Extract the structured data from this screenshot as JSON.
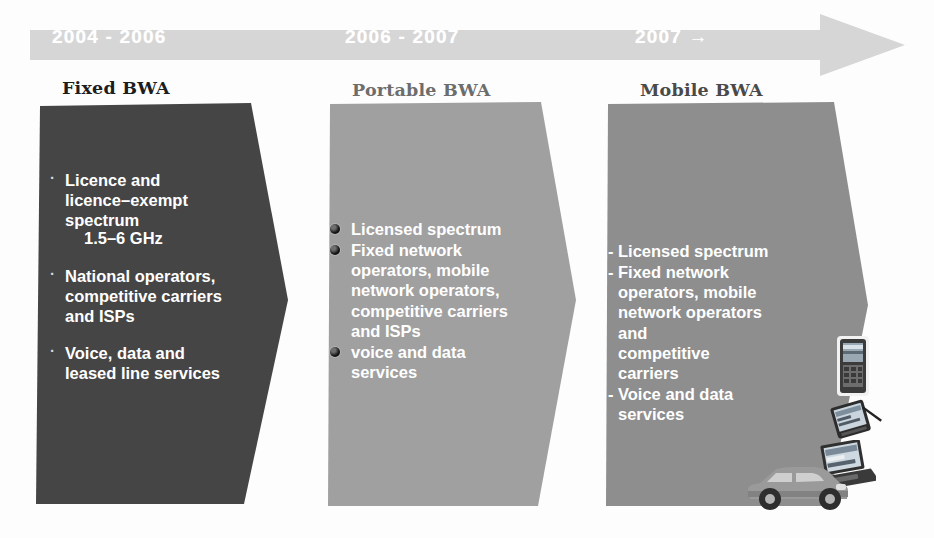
{
  "timeline": {
    "name": "BWA evolution timeline",
    "arrow_color": "#d4d4d4",
    "periods": [
      {
        "label": "2004 - 2006"
      },
      {
        "label": "2006 - 2007"
      },
      {
        "label": "2007 →"
      }
    ]
  },
  "stages": [
    {
      "heading": "Fixed BWA",
      "fill_color": "#454545",
      "bullet_glyph": "·",
      "bullets": [
        {
          "text": "Licence and\nlicence–exempt\nspectrum",
          "sub": "1.5–6 GHz"
        },
        {
          "text": "National operators,\ncompetitive carriers\nand ISPs",
          "sub": ""
        },
        {
          "text": "Voice, data and\nleased line services",
          "sub": ""
        }
      ]
    },
    {
      "heading": "Portable BWA",
      "fill_color": "#a0a0a0",
      "bullet_glyph": "circle-bullet-icon",
      "bullets": [
        {
          "text": "Licensed spectrum"
        },
        {
          "text": "Fixed network\noperators, mobile\nnetwork operators,\ncompetitive carriers\nand ISPs"
        },
        {
          "text": "voice and data\nservices"
        }
      ]
    },
    {
      "heading": "Mobile BWA",
      "fill_color": "#8e8e8e",
      "bullet_glyph": "-",
      "bullets": [
        {
          "text": "Licensed spectrum"
        },
        {
          "text": "Fixed network\noperators, mobile\nnetwork operators\nand\ncompetitive\ncarriers"
        },
        {
          "text": "Voice and data\nservices"
        }
      ]
    }
  ],
  "devices": [
    {
      "name": "mobile-phone-image"
    },
    {
      "name": "pda-handheld-image"
    },
    {
      "name": "laptop-image"
    },
    {
      "name": "car-image"
    }
  ]
}
